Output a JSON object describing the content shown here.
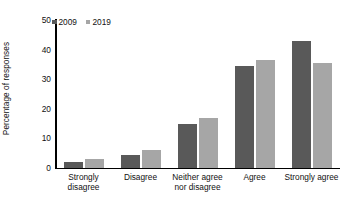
{
  "chart_data": {
    "type": "bar",
    "title": "",
    "subtitle": "",
    "xlabel": "",
    "ylabel": "Percentage of responses",
    "ylim": [
      0,
      50
    ],
    "ytick_values": [
      0,
      10,
      20,
      30,
      40,
      50
    ],
    "ytick_labels": [
      "0",
      "10",
      "20",
      "30",
      "40",
      "50"
    ],
    "grid": false,
    "legend_position": "top-left",
    "categories": [
      "Strongly disagree",
      "Disagree",
      "Neither agree nor disagree",
      "Agree",
      "Strongly agree"
    ],
    "category_lines": [
      [
        "Strongly",
        "disagree"
      ],
      [
        "Disagree",
        ""
      ],
      [
        "Neither agree",
        "nor disagree"
      ],
      [
        "Agree",
        ""
      ],
      [
        "Strongly agree",
        ""
      ]
    ],
    "series": [
      {
        "name": "2009",
        "color": "#595959",
        "values": [
          2.2,
          4.5,
          15.0,
          34.5,
          43.0
        ]
      },
      {
        "name": "2019",
        "color": "#a6a6a6",
        "values": [
          3.0,
          6.0,
          17.0,
          36.5,
          35.5
        ]
      }
    ]
  },
  "legend": {
    "items": [
      {
        "label": "2009",
        "color": "#595959"
      },
      {
        "label": "2019",
        "color": "#a6a6a6"
      }
    ]
  },
  "axes": {
    "y_title": "Percentage of responses"
  }
}
